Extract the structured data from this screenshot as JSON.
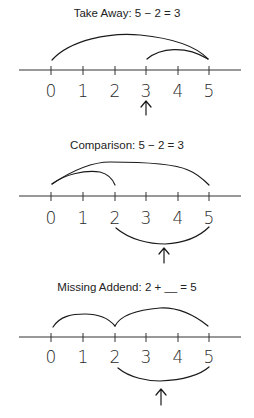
{
  "diagrams": [
    {
      "title": "Take Away: 5 − 2 = 3",
      "labels": [
        "0",
        "1",
        "2",
        "3",
        "4",
        "5"
      ],
      "arcs_above": [
        {
          "from": 0,
          "to": 5
        },
        {
          "from": 3,
          "to": 5
        }
      ],
      "arcs_below": [],
      "arrow_at": 3
    },
    {
      "title": "Comparison: 5 − 2 = 3",
      "labels": [
        "0",
        "1",
        "2",
        "3",
        "4",
        "5"
      ],
      "arcs_above": [
        {
          "from": 0,
          "to": 5
        },
        {
          "from": 0,
          "to": 2
        }
      ],
      "arcs_below": [
        {
          "from": 2,
          "to": 5
        }
      ],
      "arrow_at": 3.5
    },
    {
      "title": "Missing Addend: 2 + __ = 5",
      "labels": [
        "0",
        "1",
        "2",
        "3",
        "4",
        "5"
      ],
      "arcs_above": [
        {
          "from": 0,
          "to": 2
        },
        {
          "from": 2,
          "to": 5
        }
      ],
      "arcs_below": [
        {
          "from": 2,
          "to": 5
        }
      ],
      "arrow_at": 3.5
    }
  ]
}
